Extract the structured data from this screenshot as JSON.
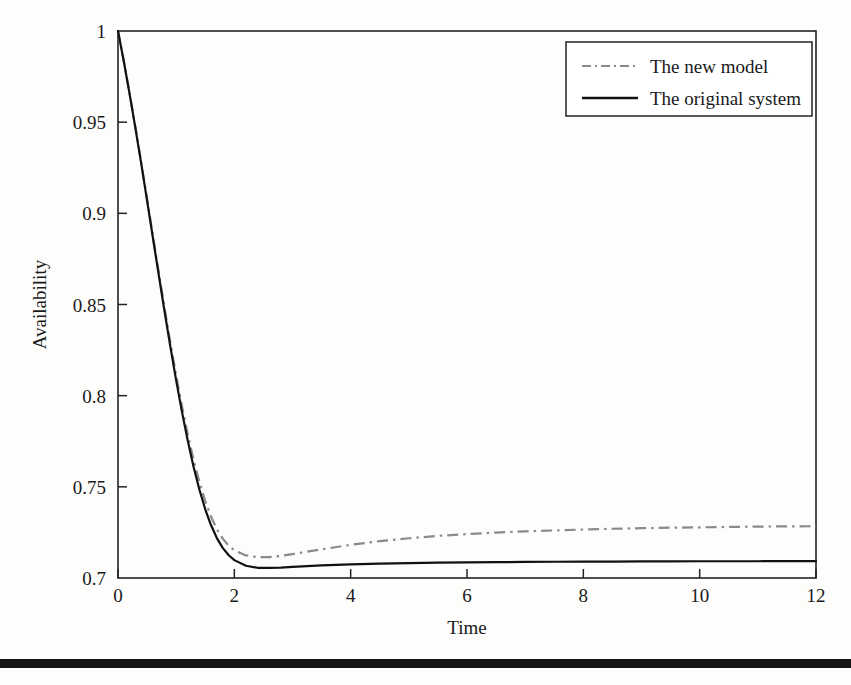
{
  "figure": {
    "background_color": "#fdfdfc",
    "frame_color": "#222222",
    "plot_area": {
      "left": 118,
      "top": 31,
      "right": 816,
      "bottom": 578
    }
  },
  "footer": {
    "name": "page-footer-rule",
    "color": "#141414",
    "top": 659,
    "height": 9
  },
  "legend": {
    "position": "top-right",
    "box": {
      "x": 566,
      "y": 42,
      "width": 246,
      "height": 74
    },
    "entries": [
      {
        "label": "The new model",
        "style": "dash-dot",
        "color": "#8a8a8a"
      },
      {
        "label": "The original system",
        "style": "solid",
        "color": "#111111"
      }
    ]
  },
  "chart_data": {
    "type": "line",
    "title": "",
    "xlabel": "Time",
    "ylabel": "Availability",
    "xlim": [
      0,
      12
    ],
    "ylim": [
      0.7,
      1
    ],
    "grid": false,
    "legend_position": "top-right",
    "xticks": [
      0,
      2,
      4,
      6,
      8,
      10,
      12
    ],
    "xtick_labels": [
      "0",
      "2",
      "4",
      "6",
      "8",
      "10",
      "12"
    ],
    "yticks": [
      0.7,
      0.75,
      0.8,
      0.85,
      0.9,
      0.95,
      1
    ],
    "ytick_labels": [
      "0.7",
      "0.75",
      "0.8",
      "0.85",
      "0.9",
      "0.95",
      "1"
    ],
    "x": [
      0,
      0.1,
      0.2,
      0.3,
      0.4,
      0.5,
      0.6,
      0.7,
      0.8,
      0.9,
      1,
      1.1,
      1.2,
      1.3,
      1.4,
      1.5,
      1.6,
      1.7,
      1.8,
      1.9,
      2,
      2.2,
      2.4,
      2.6,
      2.8,
      3,
      3.5,
      4,
      4.5,
      5,
      5.5,
      6,
      6.5,
      7,
      7.5,
      8,
      8.5,
      9,
      9.5,
      10,
      10.5,
      11,
      11.5,
      12
    ],
    "series": [
      {
        "name": "The new model",
        "style": "dash-dot",
        "color": "#8a8a8a",
        "values": [
          1,
          0.9835,
          0.9658,
          0.9472,
          0.9278,
          0.9079,
          0.8878,
          0.8678,
          0.8482,
          0.8292,
          0.8111,
          0.7942,
          0.7787,
          0.7648,
          0.7526,
          0.7422,
          0.7336,
          0.7268,
          0.7216,
          0.7178,
          0.7152,
          0.7124,
          0.7114,
          0.7115,
          0.7121,
          0.7131,
          0.7157,
          0.7182,
          0.7202,
          0.7218,
          0.7231,
          0.7241,
          0.7249,
          0.7256,
          0.7261,
          0.7266,
          0.727,
          0.7273,
          0.7276,
          0.7278,
          0.728,
          0.7282,
          0.7283,
          0.7284
        ]
      },
      {
        "name": "The original system",
        "style": "solid",
        "color": "#111111",
        "values": [
          1,
          0.9833,
          0.9654,
          0.9466,
          0.9271,
          0.907,
          0.8866,
          0.8663,
          0.8463,
          0.8269,
          0.8084,
          0.7911,
          0.7752,
          0.7609,
          0.7484,
          0.7377,
          0.7289,
          0.7219,
          0.7165,
          0.7126,
          0.7098,
          0.7067,
          0.7056,
          0.7055,
          0.7057,
          0.7061,
          0.7069,
          0.7075,
          0.7079,
          0.7082,
          0.7084,
          0.7086,
          0.7087,
          0.7088,
          0.7089,
          0.709,
          0.709,
          0.7091,
          0.7091,
          0.7092,
          0.7092,
          0.7092,
          0.7093,
          0.7093
        ]
      }
    ]
  }
}
